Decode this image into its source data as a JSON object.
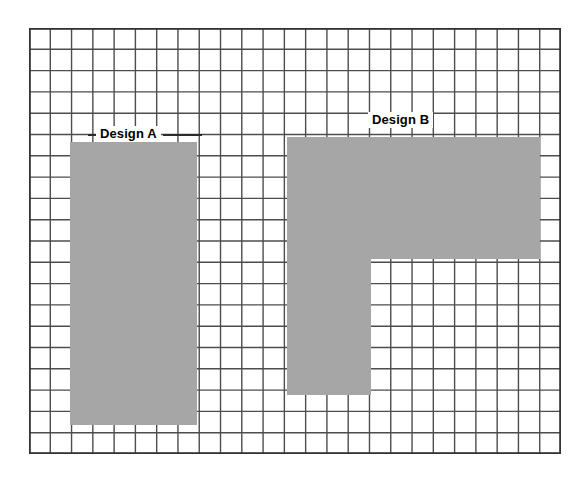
{
  "page": {
    "background_color": "#ffffff",
    "width": 583,
    "height": 478
  },
  "grid": {
    "columns": 25,
    "rows": 20,
    "cell_width": 21.3,
    "cell_height": 21.3,
    "line_color": "#4d4d4d",
    "border_color": "#333333",
    "fill_color": "#ffffff",
    "origin_x": 29,
    "origin_y": 28,
    "width": 532,
    "height": 426
  },
  "labels": {
    "design_a": "Design A",
    "design_b": "Design B"
  },
  "chart_data": {
    "type": "table",
    "xlabel": "",
    "ylabel": "",
    "grid": true,
    "legend_position": "inline",
    "shaded_color": "#a6a6a6",
    "grid_columns": 25,
    "grid_rows": 20,
    "categories": [
      "Design A",
      "Design B"
    ],
    "values": [
      80,
      120
    ],
    "series": [
      {
        "name": "Design A",
        "shape": "rectangle",
        "col_start": 2,
        "col_end": 8,
        "row_start": 5,
        "row_end": 18,
        "width_cells": 6,
        "height_cells": 13,
        "area_cells": 78
      },
      {
        "name": "Design B",
        "shape": "L-shape",
        "parts": [
          {
            "name": "top-bar",
            "col_start": 12,
            "col_end": 24,
            "row_start": 5,
            "row_end": 11,
            "width_cells": 12,
            "height_cells": 6,
            "area_cells": 72
          },
          {
            "name": "left-stem",
            "col_start": 12,
            "col_end": 16,
            "row_start": 11,
            "row_end": 17,
            "width_cells": 4,
            "height_cells": 6,
            "area_cells": 24
          }
        ],
        "area_cells": 96
      }
    ]
  }
}
